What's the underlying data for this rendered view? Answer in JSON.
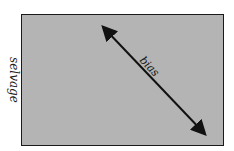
{
  "diagram": {
    "labels": {
      "left_edge": "selvage",
      "right_edge": "selvage",
      "diagonal": "bias"
    },
    "colors": {
      "fabric_fill": "#b4b4b4",
      "border": "#1a1a1a",
      "arrow": "#111111"
    },
    "arrow": {
      "x1": 101,
      "y1": 25,
      "x2": 207,
      "y2": 136,
      "double_headed": true
    }
  }
}
